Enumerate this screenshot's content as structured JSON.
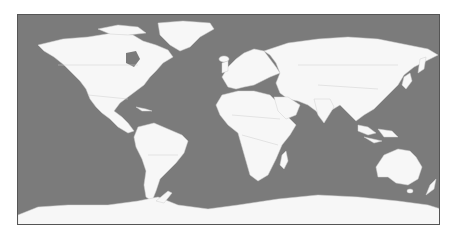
{
  "map": {
    "type": "world-political-outline",
    "projection": "equirectangular",
    "colors": {
      "ocean": "#7b7b7b",
      "land": "#f7f7f7",
      "borders": "#cfcfcf",
      "frame": "#555555",
      "background": "#ffffff"
    },
    "regions": [
      "north-america",
      "greenland",
      "south-america",
      "europe",
      "africa",
      "asia",
      "australia",
      "antarctica",
      "madagascar",
      "new-zealand",
      "japan",
      "indonesia",
      "uk",
      "iceland"
    ]
  }
}
